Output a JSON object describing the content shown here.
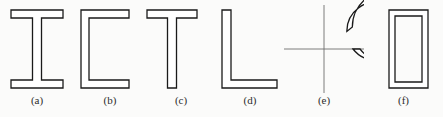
{
  "figure": {
    "caption_style": "parenthesized-letters",
    "background_color": "#fbfbfa",
    "stroke_color": "#1a1a1a",
    "centerline_color": "#6e6e6e",
    "width": 443,
    "height": 117
  },
  "shapes": [
    {
      "id": "shape-a",
      "label": "(a)",
      "name": "i-beam-section",
      "description": "I-beam wide flange cross section",
      "left": 0,
      "width": 74,
      "geometry": {
        "type": "i-beam",
        "outer_left": 11,
        "outer_right": 63,
        "outer_top": 10,
        "outer_bottom": 88,
        "flange_thickness": 8,
        "web_thickness": 9
      }
    },
    {
      "id": "shape-b",
      "label": "(b)",
      "name": "channel-section",
      "description": "Channel C shaped cross section",
      "left": 74,
      "width": 72,
      "geometry": {
        "type": "channel",
        "outer_left": 7,
        "outer_right": 55,
        "outer_top": 10,
        "outer_bottom": 88,
        "flange_thickness": 8,
        "web_thickness": 8
      }
    },
    {
      "id": "shape-c",
      "label": "(c)",
      "name": "tee-section",
      "description": "Tee shaped cross section",
      "left": 146,
      "width": 70,
      "geometry": {
        "type": "tee",
        "outer_left": 1,
        "outer_right": 51,
        "outer_top": 10,
        "outer_bottom": 88,
        "flange_thickness": 8,
        "web_thickness": 9
      }
    },
    {
      "id": "shape-d",
      "label": "(d)",
      "name": "angle-section",
      "description": "Angle L shaped cross section",
      "left": 216,
      "width": 68,
      "geometry": {
        "type": "angle",
        "outer_left": 6,
        "outer_right": 61,
        "outer_top": 10,
        "outer_bottom": 88,
        "leg_thickness": 8
      }
    },
    {
      "id": "shape-e",
      "label": "(e)",
      "name": "split-tube-section",
      "description": "Slit circular hollow tube with centerlines",
      "left": 284,
      "width": 80,
      "geometry": {
        "type": "split-tube",
        "center_x": 40,
        "center_y": 49,
        "outer_radius": 36,
        "inner_radius": 29,
        "gap_start_deg": 0,
        "gap_end_deg": -38,
        "centerline_extent": 44
      }
    },
    {
      "id": "shape-f",
      "label": "(f)",
      "name": "rectangular-tube-section",
      "description": "Rectangular hollow structural tube",
      "left": 364,
      "width": 79,
      "geometry": {
        "type": "rect-tube",
        "outer_left": 25,
        "outer_right": 64,
        "outer_top": 10,
        "outer_bottom": 88,
        "wall_thickness": 6
      }
    }
  ]
}
